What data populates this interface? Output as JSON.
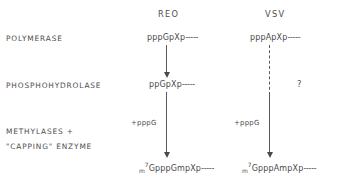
{
  "figure": {
    "columns": [
      {
        "id": "reo",
        "label": "REO"
      },
      {
        "id": "vsv",
        "label": "VSV"
      }
    ],
    "row_labels": {
      "polymerase": "POLYMERASE",
      "phosphohydrolase": "PHOSPHOHYDROLASE",
      "methylases_line1": "METHYLASES +",
      "methylases_line2": "\"CAPPING\" ENZYME"
    },
    "reo": {
      "polymerase_product": {
        "prefix": "pppGpXp",
        "dashes": "-----"
      },
      "phosphohydrolase_product": {
        "prefix": "ppGpXp",
        "dashes": "-----"
      },
      "cofactor": "+pppG",
      "capped_product": {
        "m": "m",
        "seven": "7",
        "chain": "GpppGmpXp",
        "dashes": "-----"
      },
      "arrow_top_style": "solid",
      "arrow_bottom_style": "solid"
    },
    "vsv": {
      "polymerase_product": {
        "prefix": "pppApXp",
        "dashes": "-----"
      },
      "phosphohydrolase_product": null,
      "uncertainty_marker": "?",
      "cofactor": "+pppG",
      "capped_product": {
        "m": "m",
        "seven": "7",
        "chain": "GpppAmpXp",
        "dashes": "-----"
      },
      "arrow_top_style": "dashed",
      "arrow_bottom_style": "solid"
    },
    "colors": {
      "text": "#4a4a4a",
      "line": "#5a5a5a",
      "background": "#ffffff"
    }
  }
}
